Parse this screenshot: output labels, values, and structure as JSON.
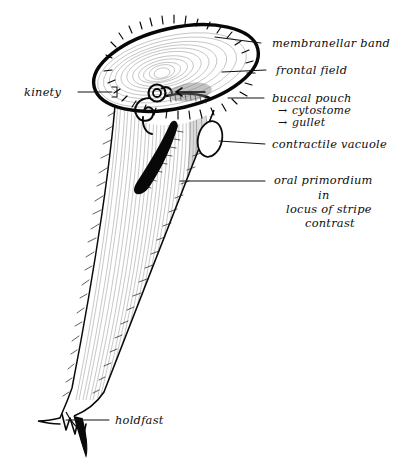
{
  "figure": {
    "style": "hand-drawn pen-and-ink line drawing, black ink on white",
    "organism_shape": "elongate trumpet / cone tapering to a forked holdfast"
  },
  "colors": {
    "ink": "#0d0d0d",
    "background": "#ffffff",
    "stripe_light": "#9a9a9a",
    "stripe_dark": "#6f6f6f",
    "solid_black": "#050505"
  },
  "labels": [
    {
      "id": "membranellar-band",
      "text": "membranellar band",
      "x": 272,
      "y": 47,
      "leader": {
        "x1": 261,
        "y1": 43,
        "x2": 215,
        "y2": 37
      }
    },
    {
      "id": "frontal-field",
      "text": "frontal field",
      "x": 276,
      "y": 74,
      "leader": {
        "x1": 266,
        "y1": 70,
        "x2": 222,
        "y2": 72
      }
    },
    {
      "id": "buccal-pouch",
      "text": "buccal pouch",
      "x": 272,
      "y": 102,
      "leader": {
        "x1": 264,
        "y1": 98,
        "x2": 228,
        "y2": 98
      }
    },
    {
      "id": "cytostome",
      "text": "cytostome",
      "arrow": "→",
      "x": 292,
      "y": 114,
      "arrow_x": 278
    },
    {
      "id": "gullet",
      "text": "gullet",
      "arrow": "→",
      "x": 292,
      "y": 126,
      "arrow_x": 278
    },
    {
      "id": "contractile-vacuole",
      "text": "contractile vacuole",
      "x": 272,
      "y": 148,
      "leader": {
        "x1": 265,
        "y1": 144,
        "x2": 219,
        "y2": 141
      }
    },
    {
      "id": "oral-primordium",
      "text": "oral primordium",
      "x": 274,
      "y": 184,
      "leader": {
        "x1": 265,
        "y1": 181,
        "x2": 180,
        "y2": 181
      }
    },
    {
      "id": "oral-primordium-in",
      "text": "in",
      "x": 318,
      "y": 199
    },
    {
      "id": "locus-of-stripe",
      "text": "locus of stripe",
      "x": 286,
      "y": 213
    },
    {
      "id": "contrast",
      "text": "contrast",
      "x": 305,
      "y": 227
    },
    {
      "id": "kinety",
      "text": "kinety",
      "x": 24,
      "y": 96,
      "leader": {
        "x1": 78,
        "y1": 92,
        "x2": 112,
        "y2": 92
      }
    },
    {
      "id": "holdfast",
      "text": "holdfast",
      "x": 115,
      "y": 424,
      "leader": {
        "x1": 109,
        "y1": 420,
        "x2": 66,
        "y2": 420
      }
    }
  ],
  "structures": [
    {
      "id": "membranellar-band",
      "kind": "ciliated-ring",
      "note": "thick black elliptical rim bearing fine membranelles around the anterior oral region"
    },
    {
      "id": "frontal-field",
      "kind": "concentric-striated-disc",
      "note": "oval anterior face with concentric growth striations"
    },
    {
      "id": "buccal-pouch",
      "kind": "spiral-invagination",
      "note": "spiral curl leading inward at the left of the oral rim"
    },
    {
      "id": "cytostome",
      "kind": "aperture",
      "note": "mouth opening inside the buccal pouch"
    },
    {
      "id": "gullet",
      "kind": "channel",
      "note": "tube descending from the cytostome"
    },
    {
      "id": "contractile-vacuole",
      "kind": "oval-vesicle",
      "note": "outlined oval on the right flank below the oral rim"
    },
    {
      "id": "oral-primordium",
      "kind": "solid-black-band",
      "note": "thick curved comma-shaped band in the locus of stripe contrast, bearing fine bristles"
    },
    {
      "id": "kinety",
      "kind": "longitudinal-stripe",
      "note": "one of many vertical ciliary rows running the length of the body"
    },
    {
      "id": "holdfast",
      "kind": "forked-attachment",
      "note": "pointed split anchor at the posterior tip"
    }
  ]
}
